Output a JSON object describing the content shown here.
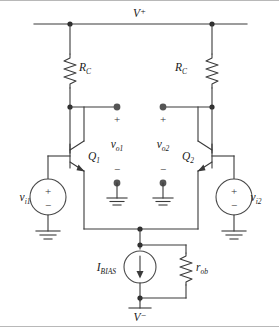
{
  "figure": {
    "background_color": "#ffffff",
    "line_color": "#3a3a3a",
    "node_color": "#2e2e2e",
    "terminal_color": "#555555",
    "border_color": "#b8b8b8"
  },
  "labels": {
    "supply_positive": "V",
    "supply_positive_sign": "+",
    "supply_negative": "V",
    "supply_negative_sign": "−",
    "resistor_left": "R",
    "resistor_left_sub": "C",
    "resistor_right": "R",
    "resistor_right_sub": "C",
    "transistor_left": "Q",
    "transistor_left_sub": "1",
    "transistor_right": "Q",
    "transistor_right_sub": "2",
    "output_left": "v",
    "output_left_sub": "o1",
    "output_right": "v",
    "output_right_sub": "o2",
    "input_left": "v",
    "input_left_sub": "i1",
    "input_right": "v",
    "input_right_sub": "i2",
    "bias_current": "I",
    "bias_current_sub": "BIAS",
    "output_resistance": "r",
    "output_resistance_sub": "ob",
    "plus_sign": "+",
    "minus_sign": "−"
  },
  "components": [
    {
      "id": "rc-left",
      "type": "resistor",
      "label": "R_C"
    },
    {
      "id": "rc-right",
      "type": "resistor",
      "label": "R_C"
    },
    {
      "id": "q1",
      "type": "npn-transistor",
      "label": "Q1"
    },
    {
      "id": "q2",
      "type": "npn-transistor",
      "label": "Q2"
    },
    {
      "id": "vi1",
      "type": "voltage-source",
      "label": "v_i1"
    },
    {
      "id": "vi2",
      "type": "voltage-source",
      "label": "v_i2"
    },
    {
      "id": "ibias",
      "type": "current-source",
      "label": "I_BIAS"
    },
    {
      "id": "rob",
      "type": "resistor",
      "label": "r_ob"
    },
    {
      "id": "vo1",
      "type": "output-port",
      "label": "v_o1"
    },
    {
      "id": "vo2",
      "type": "output-port",
      "label": "v_o2"
    },
    {
      "id": "gnd-vi1",
      "type": "ground",
      "label": "ground"
    },
    {
      "id": "gnd-vi2",
      "type": "ground",
      "label": "ground"
    },
    {
      "id": "gnd-vo1",
      "type": "ground",
      "label": "ground"
    },
    {
      "id": "gnd-vo2",
      "type": "ground",
      "label": "ground"
    }
  ]
}
